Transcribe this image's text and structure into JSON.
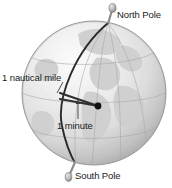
{
  "figure": {
    "type": "globe-diagram",
    "width": 172,
    "height": 188,
    "background_color": "#ffffff"
  },
  "labels": {
    "north_pole": "North Pole",
    "south_pole": "South Pole",
    "nautical_mile": "1 nautical mile",
    "minute": "1 minute"
  },
  "icons": {
    "north_pole_pin": "pin-icon",
    "south_pole_pin": "pin-icon",
    "center_point": "center-dot-icon",
    "minute_arrow": "arrow-down-icon"
  },
  "colors": {
    "globe_light": "#f2f2f2",
    "globe_mid": "#d8d8d8",
    "globe_dark": "#b5b5b5",
    "globe_outline": "#9a9a9a",
    "meridian": "#2b2b2b",
    "graticule": "#a8a8a8",
    "land": "#cdcdcd",
    "text": "#1a1a1a",
    "wedge_line": "#333333",
    "background": "#ffffff"
  },
  "geometry": {
    "globe_center_x": 94,
    "globe_center_y": 93,
    "globe_radius": 72,
    "center_dot_x": 98,
    "center_dot_y": 106,
    "wedge_end_upper_x": 60,
    "wedge_end_upper_y": 93,
    "wedge_end_lower_x": 60,
    "wedge_end_lower_y": 99,
    "north_pole_x": 108,
    "north_pole_y": 23,
    "south_pole_x": 76,
    "south_pole_y": 165
  }
}
